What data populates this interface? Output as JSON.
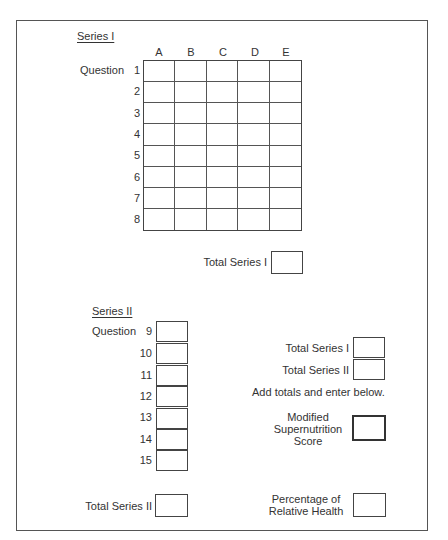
{
  "series1": {
    "title": "Series I",
    "question_label": "Question",
    "columns": [
      "A",
      "B",
      "C",
      "D",
      "E"
    ],
    "rows": [
      "1",
      "2",
      "3",
      "4",
      "5",
      "6",
      "7",
      "8"
    ],
    "total_label": "Total Series I"
  },
  "series2": {
    "title": "Series II",
    "question_label": "Question",
    "questions": [
      "9",
      "10",
      "11",
      "12",
      "13",
      "14",
      "15"
    ],
    "total_label": "Total Series II"
  },
  "summary": {
    "total_series1_label": "Total Series I",
    "total_series2_label": "Total Series II",
    "instruction": "Add totals and enter below.",
    "score_label_line1": "Modified",
    "score_label_line2": "Supernutrition",
    "score_label_line3": "Score",
    "percentage_label_line1": "Percentage of",
    "percentage_label_line2": "Relative Health"
  }
}
